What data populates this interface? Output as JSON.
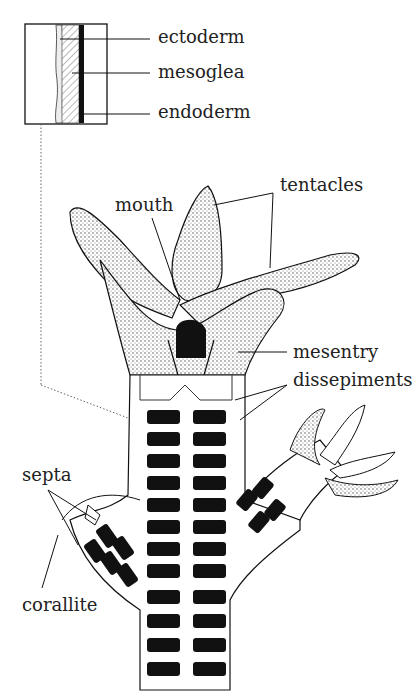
{
  "diagram": {
    "inset_labels": {
      "ectoderm": "ectoderm",
      "mesoglea": "mesoglea",
      "endoderm": "endoderm"
    },
    "labels": {
      "mouth": "mouth",
      "tentacles": "tentacles",
      "mesentry": "mesentry",
      "dissepiments": "dissepiments",
      "septa": "septa",
      "corallite": "corallite"
    },
    "colors": {
      "ink": "#111111",
      "stipple": "#555555",
      "paper": "#ffffff"
    }
  }
}
